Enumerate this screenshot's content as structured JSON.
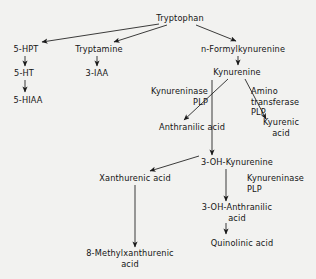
{
  "diagram": {
    "background_color": "#f2f2f0",
    "line_color": "#1a1a1a",
    "text_color": "#141414",
    "nodes": [
      {
        "id": "tryptophan",
        "label": "Tryptophan",
        "x": 180,
        "y": 18
      },
      {
        "id": "5-hpt",
        "label": "5-HPT",
        "x": 26,
        "y": 49
      },
      {
        "id": "tryptamine",
        "label": "Tryptamine",
        "x": 99,
        "y": 49
      },
      {
        "id": "n-formylkynurenine",
        "label": "n-Formylkynurenine",
        "x": 243,
        "y": 49
      },
      {
        "id": "5-ht",
        "label": "5-HT",
        "x": 24,
        "y": 73
      },
      {
        "id": "3-iaa",
        "label": "3-IAA",
        "x": 97,
        "y": 73
      },
      {
        "id": "kynurenine",
        "label": "Kynurenine",
        "x": 237,
        "y": 72
      },
      {
        "id": "5-hiaa",
        "label": "5-HIAA",
        "x": 28,
        "y": 100
      },
      {
        "id": "anthranilic-acid",
        "label": "Anthranilic acid",
        "x": 192,
        "y": 127
      },
      {
        "id": "kyurenic-acid",
        "label": "Kyurenic\nacid",
        "x": 281,
        "y": 127
      },
      {
        "id": "3-oh-kynurenine",
        "label": "3-OH-Kynurenine",
        "x": 237,
        "y": 162
      },
      {
        "id": "xanthurenic-acid",
        "label": "Xanthurenic acid",
        "x": 135,
        "y": 178
      },
      {
        "id": "3-oh-anthranilic-acid",
        "label": "3-OH-Anthranilic\nacid",
        "x": 237,
        "y": 212
      },
      {
        "id": "quinolinic-acid",
        "label": "Quinolinic acid",
        "x": 242,
        "y": 243
      },
      {
        "id": "8-methylxanthurenic",
        "label": "8-Methylxanthurenic\nacid",
        "x": 130,
        "y": 258
      }
    ],
    "enzyme_labels": [
      {
        "id": "kynureninase-plp-1",
        "label": "Kynureninase\nPLP",
        "x": 208,
        "y": 86,
        "align": "right"
      },
      {
        "id": "amino-transferase-plp",
        "label": "Amino\ntransferase\nPLP",
        "x": 251,
        "y": 86,
        "align": "left"
      },
      {
        "id": "kynureninase-plp-2",
        "label": "Kynureninase\nPLP",
        "x": 247,
        "y": 173,
        "align": "left"
      }
    ],
    "edges": [
      {
        "id": "tryptophan-to-5-hpt",
        "from": "tryptophan",
        "to": "5-hpt"
      },
      {
        "id": "tryptophan-to-tryptamine",
        "from": "tryptophan",
        "to": "tryptamine"
      },
      {
        "id": "tryptophan-to-n-formylkynurenine",
        "from": "tryptophan",
        "to": "n-formylkynurenine"
      },
      {
        "id": "5-hpt-to-5-ht",
        "from": "5-hpt",
        "to": "5-ht"
      },
      {
        "id": "5-ht-to-5-hiaa",
        "from": "5-ht",
        "to": "5-hiaa"
      },
      {
        "id": "tryptamine-to-3-iaa",
        "from": "tryptamine",
        "to": "3-iaa"
      },
      {
        "id": "n-formylkynurenine-to-kynurenine",
        "from": "n-formylkynurenine",
        "to": "kynurenine"
      },
      {
        "id": "kynurenine-to-anthranilic-acid",
        "from": "kynurenine",
        "to": "anthranilic-acid"
      },
      {
        "id": "kynurenine-to-kyurenic-acid",
        "from": "kynurenine",
        "to": "kyurenic-acid"
      },
      {
        "id": "kynurenine-to-3-oh-kynurenine",
        "from": "kynurenine",
        "to": "3-oh-kynurenine"
      },
      {
        "id": "3-oh-kynurenine-to-xanthurenic-acid",
        "from": "3-oh-kynurenine",
        "to": "xanthurenic-acid"
      },
      {
        "id": "3-oh-kynurenine-to-3-oh-anthranilic",
        "from": "3-oh-kynurenine",
        "to": "3-oh-anthranilic-acid"
      },
      {
        "id": "3-oh-anthranilic-to-quinolinic-acid",
        "from": "3-oh-anthranilic-acid",
        "to": "quinolinic-acid"
      },
      {
        "id": "xanthurenic-to-8-methylxanthurenic",
        "from": "xanthurenic-acid",
        "to": "8-methylxanthurenic"
      }
    ],
    "edge_geometry": [
      {
        "id": "tryptophan-to-5-hpt",
        "x1": 159,
        "y1": 24,
        "x2": 42,
        "y2": 42
      },
      {
        "id": "tryptophan-to-tryptamine",
        "x1": 167,
        "y1": 25,
        "x2": 114,
        "y2": 42
      },
      {
        "id": "tryptophan-to-n-formylkynurenine",
        "x1": 196,
        "y1": 25,
        "x2": 236,
        "y2": 41
      },
      {
        "id": "5-hpt-to-5-ht",
        "x1": 25,
        "y1": 56,
        "x2": 25,
        "y2": 66
      },
      {
        "id": "5-ht-to-5-hiaa",
        "x1": 25,
        "y1": 80,
        "x2": 25,
        "y2": 92
      },
      {
        "id": "tryptamine-to-3-iaa",
        "x1": 97,
        "y1": 56,
        "x2": 97,
        "y2": 66
      },
      {
        "id": "n-formylkynurenine-to-kynurenine",
        "x1": 238,
        "y1": 56,
        "x2": 238,
        "y2": 65
      },
      {
        "id": "kynurenine-to-anthranilic-acid",
        "x1": 228,
        "y1": 79,
        "x2": 184,
        "y2": 120
      },
      {
        "id": "kynurenine-to-kyurenic-acid",
        "x1": 245,
        "y1": 79,
        "x2": 266,
        "y2": 119
      },
      {
        "id": "kynurenine-to-3-oh-kynurenine",
        "x1": 212,
        "y1": 80,
        "x2": 212,
        "y2": 155
      },
      {
        "id": "3-oh-kynurenine-to-xanthurenic-acid",
        "x1": 199,
        "y1": 156,
        "x2": 150,
        "y2": 171
      },
      {
        "id": "3-oh-kynurenine-to-3-oh-anthranilic",
        "x1": 226,
        "y1": 169,
        "x2": 226,
        "y2": 201
      },
      {
        "id": "3-oh-anthranilic-to-quinolinic-acid",
        "x1": 226,
        "y1": 223,
        "x2": 226,
        "y2": 234
      },
      {
        "id": "xanthurenic-to-8-methylxanthurenic",
        "x1": 135,
        "y1": 185,
        "x2": 135,
        "y2": 247
      }
    ]
  }
}
